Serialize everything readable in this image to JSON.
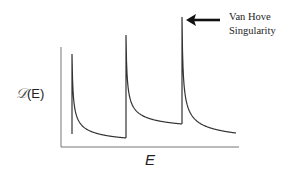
{
  "chart_data": {
    "type": "line",
    "title": "",
    "xlabel": "E",
    "ylabel_symbol": "𝒟",
    "ylabel_arg": "(E)",
    "ylabel": "𝒟(E)",
    "grid": false,
    "legend": null,
    "axes_px": {
      "x0": 61,
      "y0": 147,
      "x1": 239,
      "ytop": 47
    },
    "series": [
      {
        "name": "density of states",
        "color": "#333333",
        "segments": [
          {
            "onset_x": 72,
            "peak_y": 54,
            "end_x": 126,
            "end_y": 138
          },
          {
            "onset_x": 126,
            "peak_y": 35,
            "end_x": 182,
            "end_y": 124
          },
          {
            "onset_x": 182,
            "peak_y": 17,
            "end_x": 236,
            "end_y": 133
          }
        ]
      }
    ],
    "annotations": [
      {
        "text_line1": "Van Hove",
        "text_line2": "Singularity",
        "arrow_from_x": 220,
        "arrow_to_x": 186,
        "arrow_y": 20
      }
    ]
  },
  "labels": {
    "ylabel_symbol": "𝒟",
    "ylabel_arg": "(E)",
    "xlabel": "E",
    "annotation_line1": "Van Hove",
    "annotation_line2": "Singularity"
  }
}
